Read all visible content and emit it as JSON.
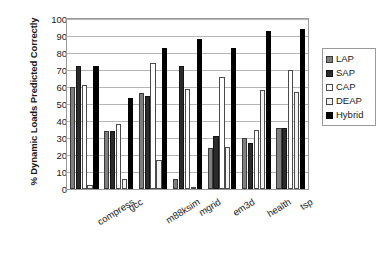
{
  "chart_data": {
    "type": "bar",
    "title": "",
    "xlabel": "",
    "ylabel": "% Dynamic Loads Predicted Correctly",
    "ylim": [
      0,
      100
    ],
    "yticks": [
      0,
      10,
      20,
      30,
      40,
      50,
      60,
      70,
      80,
      90,
      100
    ],
    "grid": true,
    "legend_position": "right",
    "categories": [
      "compress",
      "gcc",
      "m88ksim",
      "mgrid",
      "em3d",
      "health",
      "tsp"
    ],
    "series": [
      {
        "name": "LAP",
        "color": "#7f7f7f",
        "values": [
          60,
          34,
          56.5,
          6,
          24,
          30,
          36
        ]
      },
      {
        "name": "SAP",
        "color": "#2b2b2b",
        "values": [
          72.5,
          34,
          55,
          72.5,
          31,
          27,
          36
        ]
      },
      {
        "name": "CAP",
        "color": "#ffffff",
        "values": [
          61,
          38,
          74,
          59,
          66,
          35,
          70
        ]
      },
      {
        "name": "DEAP",
        "color": "#f2f2f2",
        "values": [
          2.5,
          6,
          17,
          1,
          25,
          58.5,
          57
        ]
      },
      {
        "name": "Hybrid",
        "color": "#000000",
        "values": [
          72.5,
          53.5,
          83,
          88.5,
          83,
          93,
          94
        ]
      }
    ]
  },
  "legend": {
    "items": [
      {
        "label": "LAP"
      },
      {
        "label": "SAP"
      },
      {
        "label": "CAP"
      },
      {
        "label": "DEAP"
      },
      {
        "label": "Hybrid"
      }
    ]
  }
}
